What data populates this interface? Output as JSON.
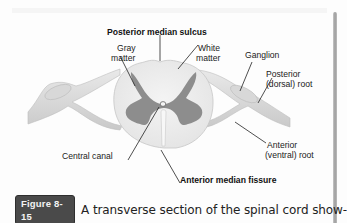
{
  "figure": {
    "labels": {
      "posterior_median_sulcus": "Posterior median sulcus",
      "gray_matter_line1": "Gray",
      "gray_matter_line2": "matter",
      "white_matter_line1": "White",
      "white_matter_line2": "matter",
      "ganglion": "Ganglion",
      "posterior_root_line1": "Posterior",
      "posterior_root_line2": "(dorsal) root",
      "central_canal": "Central canal",
      "anterior_root_line1": "Anterior",
      "anterior_root_line2": "(ventral) root",
      "anterior_median_fissure": "Anterior median fissure"
    },
    "colors": {
      "white_matter": "#eeeeee",
      "gray_matter": "#8a8a8a",
      "nerve": "#d9d9d9",
      "leader_line": "#222222"
    }
  },
  "caption": {
    "badge": "Figure 8-15",
    "text": "A transverse section of the spinal cord show-"
  }
}
